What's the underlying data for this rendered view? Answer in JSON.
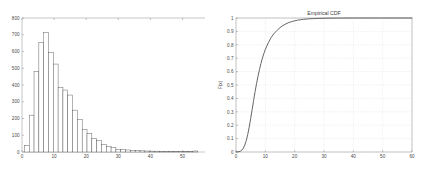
{
  "figure": {
    "background_color": "#ffffff",
    "panel_count": 2
  },
  "chart_data": [
    {
      "type": "bar",
      "name": "histogram",
      "title": "",
      "xlabel": "",
      "ylabel": "",
      "xlim": [
        0,
        57
      ],
      "ylim": [
        0,
        800
      ],
      "grid": false,
      "bar_color": "#ffffff",
      "edge_color": "#555555",
      "axis_color": "#8c8c8c",
      "xticks": [
        0,
        10,
        20,
        30,
        40,
        50
      ],
      "xtick_labels": [
        "0",
        "10",
        "20",
        "30",
        "40",
        "50"
      ],
      "yticks": [
        0,
        100,
        200,
        300,
        400,
        500,
        600,
        700,
        800
      ],
      "ytick_labels": [
        "0",
        "100",
        "200",
        "300",
        "400",
        "500",
        "600",
        "700",
        "800"
      ],
      "bin_width": 1.5,
      "bin_centers": [
        1.5,
        3.0,
        4.5,
        6.0,
        7.5,
        9.0,
        10.5,
        12.0,
        13.5,
        15.0,
        16.5,
        18.0,
        19.5,
        21.0,
        22.5,
        24.0,
        25.5,
        27.0,
        28.5,
        30.0,
        31.5,
        33.0,
        34.5,
        36.0,
        37.5,
        39.0,
        40.5,
        42.0,
        43.5,
        45.0,
        46.5,
        48.0,
        49.5,
        51.0,
        52.5,
        54.0
      ],
      "values": [
        40,
        220,
        480,
        655,
        715,
        595,
        525,
        385,
        370,
        340,
        250,
        195,
        135,
        110,
        80,
        70,
        45,
        32,
        28,
        16,
        14,
        12,
        10,
        8,
        7,
        6,
        5,
        5,
        4,
        4,
        3,
        3,
        3,
        2,
        2,
        6
      ]
    },
    {
      "type": "line",
      "name": "empirical-cdf",
      "title": "Empirical CDF",
      "xlabel": "",
      "ylabel": "F(x)",
      "xlim": [
        0,
        60
      ],
      "ylim": [
        0,
        1
      ],
      "grid": true,
      "grid_style": "dotted",
      "line_color": "#555555",
      "axis_color": "#8c8c8c",
      "xticks": [
        0,
        10,
        20,
        30,
        40,
        50,
        60
      ],
      "xtick_labels": [
        "0",
        "10",
        "20",
        "30",
        "40",
        "50",
        "60"
      ],
      "yticks": [
        0,
        0.1,
        0.2,
        0.3,
        0.4,
        0.5,
        0.6,
        0.7,
        0.8,
        0.9,
        1
      ],
      "ytick_labels": [
        "0",
        "0.1",
        "0.2",
        "0.3",
        "0.4",
        "0.5",
        "0.6",
        "0.7",
        "0.8",
        "0.9",
        "1"
      ],
      "x": [
        0,
        1,
        1.5,
        2,
        2.5,
        3,
        3.5,
        4,
        4.5,
        5,
        5.5,
        6,
        6.5,
        7,
        7.5,
        8,
        8.5,
        9,
        9.5,
        10,
        11,
        12,
        13,
        14,
        15,
        16,
        17,
        18,
        19,
        20,
        21,
        22,
        23,
        24,
        25,
        26,
        27,
        28,
        30,
        32,
        35,
        40,
        45,
        50,
        55,
        60
      ],
      "y": [
        0,
        0.002,
        0.006,
        0.014,
        0.028,
        0.052,
        0.085,
        0.13,
        0.185,
        0.25,
        0.315,
        0.385,
        0.45,
        0.51,
        0.565,
        0.615,
        0.66,
        0.7,
        0.735,
        0.765,
        0.815,
        0.855,
        0.885,
        0.908,
        0.928,
        0.944,
        0.956,
        0.966,
        0.973,
        0.979,
        0.984,
        0.987,
        0.99,
        0.992,
        0.994,
        0.995,
        0.996,
        0.997,
        0.998,
        0.999,
        0.9995,
        1,
        1,
        1,
        1,
        1
      ]
    }
  ]
}
